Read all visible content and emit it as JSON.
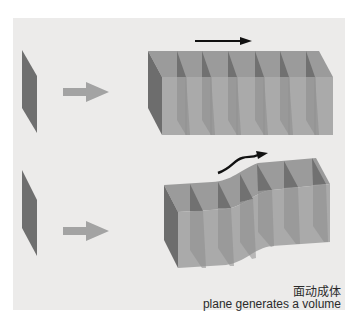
{
  "diagram": {
    "title_zh": "面动成体",
    "title_en": "plane generates a volume",
    "colors": {
      "background": "#ecebea",
      "plane": "#6f6f6f",
      "arrow": "#a3a3a3",
      "volume_face": "#a9a9a9",
      "volume_top": "#9a9a9a",
      "volume_side": "#6d6d6d",
      "motion_arrow": "#111111"
    },
    "rows": [
      {
        "label": "straight translation",
        "source": "plane",
        "operation": "arrow",
        "result": "rectangular prism",
        "motion": "straight arrow"
      },
      {
        "label": "curved translation",
        "source": "plane",
        "operation": "arrow",
        "result": "wavy volume",
        "motion": "curved arrow"
      }
    ]
  }
}
